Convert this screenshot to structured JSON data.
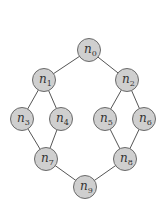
{
  "diagram": {
    "type": "graph",
    "colors": {
      "node_fill": "#cfcfcf",
      "node_stroke": "#6a6a6a",
      "edge": "#555555",
      "background": "#ffffff"
    },
    "node_radius": 11.5,
    "nodes": [
      {
        "id": "n0",
        "base": "n",
        "sub": "0",
        "x": 89,
        "y": 50
      },
      {
        "id": "n1",
        "base": "n",
        "sub": "1",
        "x": 44,
        "y": 80
      },
      {
        "id": "n2",
        "base": "n",
        "sub": "2",
        "x": 127,
        "y": 80
      },
      {
        "id": "n3",
        "base": "n",
        "sub": "3",
        "x": 22,
        "y": 119
      },
      {
        "id": "n4",
        "base": "n",
        "sub": "4",
        "x": 61,
        "y": 119
      },
      {
        "id": "n5",
        "base": "n",
        "sub": "5",
        "x": 105,
        "y": 119
      },
      {
        "id": "n6",
        "base": "n",
        "sub": "6",
        "x": 144,
        "y": 119
      },
      {
        "id": "n7",
        "base": "n",
        "sub": "7",
        "x": 46,
        "y": 159
      },
      {
        "id": "n8",
        "base": "n",
        "sub": "8",
        "x": 125,
        "y": 159
      },
      {
        "id": "n9",
        "base": "n",
        "sub": "9",
        "x": 85,
        "y": 187
      }
    ],
    "edges": [
      [
        "n0",
        "n1"
      ],
      [
        "n0",
        "n2"
      ],
      [
        "n1",
        "n3"
      ],
      [
        "n1",
        "n4"
      ],
      [
        "n2",
        "n5"
      ],
      [
        "n2",
        "n6"
      ],
      [
        "n3",
        "n7"
      ],
      [
        "n4",
        "n7"
      ],
      [
        "n5",
        "n8"
      ],
      [
        "n6",
        "n8"
      ],
      [
        "n7",
        "n9"
      ],
      [
        "n8",
        "n9"
      ]
    ]
  }
}
